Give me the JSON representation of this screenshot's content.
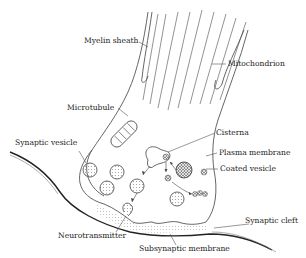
{
  "diagram": {
    "type": "anatomical-illustration",
    "colors": {
      "line": "#555555",
      "dark_line": "#222222",
      "text": "#222222",
      "fill_light": "#e6e6e6",
      "background": "#ffffff"
    },
    "labels": {
      "myelin_sheath": "Myelin sheath",
      "mitochondrion": "Mitochondrion",
      "microtubule": "Microtubule",
      "cisterna": "Cisterna",
      "synaptic_vesicle": "Synaptic vesicle",
      "plasma_membrane": "Plasma membrane",
      "coated_vesicle": "Coated vesicle",
      "synaptic_cleft": "Synaptic cleft",
      "neurotransmitter": "Neurotransmitter",
      "subsynaptic_membrane": "Subsynaptic membrane"
    }
  }
}
